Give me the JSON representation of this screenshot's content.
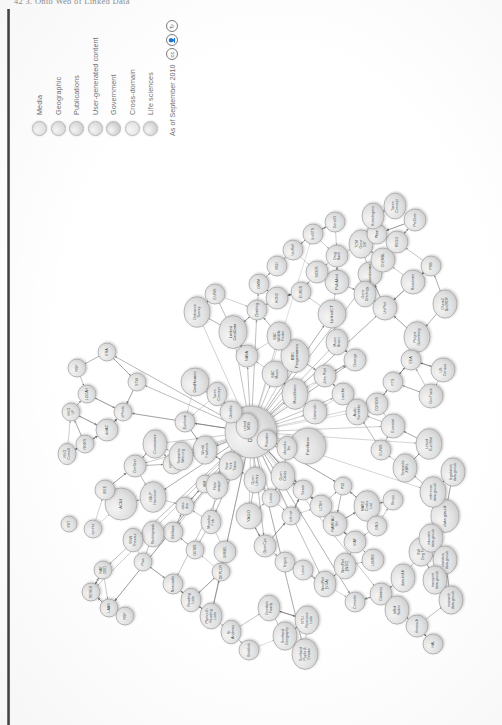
{
  "page": {
    "header": "42     3. Onto Web of Linked Data",
    "background_color": "#ffffff",
    "gutter_color": "#333333"
  },
  "figure": {
    "orientation": "rotated-90-ccw",
    "hub_node": "DBpedia"
  },
  "legend": {
    "items": [
      {
        "label": "Media",
        "color": "#e2e2e2"
      },
      {
        "label": "Geographic",
        "color": "#dcdcdc"
      },
      {
        "label": "Publications",
        "color": "#d6d6d6"
      },
      {
        "label": "User-generated content",
        "color": "#dadada"
      },
      {
        "label": "Government",
        "color": "#cdcdcd"
      },
      {
        "label": "Cross-domain",
        "color": "#e4e4e4"
      },
      {
        "label": "Life sciences",
        "color": "#d2d2d2"
      }
    ],
    "date_text": "As of September 2010",
    "license_icons": [
      "cc-circle-icon",
      "cc-by-icon",
      "cc-sa-icon"
    ]
  },
  "chart_data": {
    "type": "diagram",
    "subtitle": "As of September 2010",
    "node_count_approx": 203,
    "categories": [
      "Media",
      "Geographic",
      "Publications",
      "User-generated content",
      "Government",
      "Cross-domain",
      "Life sciences"
    ],
    "hub": "DBpedia",
    "nodes": [
      {
        "id": "DBpedia",
        "x": 280,
        "y": 226,
        "r": 26,
        "cat": "Cross-domain",
        "size": "big"
      },
      {
        "id": "Freebase",
        "x": 266,
        "y": 283,
        "r": 18,
        "cat": "Cross-domain",
        "size": "mid"
      },
      {
        "id": "GeoNames",
        "x": 330,
        "y": 170,
        "r": 14,
        "cat": "Geographic",
        "size": "mid"
      },
      {
        "id": "LinkedCT",
        "x": 398,
        "y": 307,
        "r": 14,
        "cat": "Life sciences",
        "size": "mid"
      },
      {
        "id": "PubMed",
        "x": 430,
        "y": 312,
        "r": 12,
        "cat": "Life sciences",
        "size": "mid"
      },
      {
        "id": "Diseasome",
        "x": 438,
        "y": 345,
        "r": 12,
        "cat": "Life sciences",
        "size": "mid"
      },
      {
        "id": "Gene\nOntology",
        "x": 418,
        "y": 340,
        "r": 11,
        "cat": "Life sciences"
      },
      {
        "id": "UniProt",
        "x": 404,
        "y": 360,
        "r": 12,
        "cat": "Life sciences"
      },
      {
        "id": "Project\nGutenberg",
        "x": 375,
        "y": 392,
        "r": 13,
        "cat": "Publications"
      },
      {
        "id": "ACM",
        "x": 208,
        "y": 96,
        "r": 16,
        "cat": "Publications",
        "size": "mid"
      },
      {
        "id": "IEEE",
        "x": 222,
        "y": 80,
        "r": 10,
        "cat": "Publications"
      },
      {
        "id": "CiteSeer",
        "x": 246,
        "y": 110,
        "r": 11,
        "cat": "Publications"
      },
      {
        "id": "DBLP\nHannover",
        "x": 215,
        "y": 128,
        "r": 13,
        "cat": "Publications"
      },
      {
        "id": "eprints",
        "x": 183,
        "y": 68,
        "r": 9,
        "cat": "Publications"
      },
      {
        "id": "RESEX",
        "x": 120,
        "y": 66,
        "r": 9,
        "cat": "Publications"
      },
      {
        "id": "RAE\n2001",
        "x": 142,
        "y": 78,
        "r": 9,
        "cat": "Publications"
      },
      {
        "id": "Pisa",
        "x": 150,
        "y": 118,
        "r": 9,
        "cat": "Publications"
      },
      {
        "id": "LAAS",
        "x": 104,
        "y": 84,
        "r": 9,
        "cat": "Publications"
      },
      {
        "id": "NSF",
        "x": 96,
        "y": 100,
        "r": 9,
        "cat": "Government"
      },
      {
        "id": "IRIT",
        "x": 188,
        "y": 44,
        "r": 8,
        "cat": "Publications"
      },
      {
        "id": "VIVO\nCornell",
        "x": 258,
        "y": 42,
        "r": 9,
        "cat": "Publications"
      },
      {
        "id": "VIVO\nUF",
        "x": 300,
        "y": 46,
        "r": 9,
        "cat": "Publications"
      },
      {
        "id": "RISKS",
        "x": 268,
        "y": 60,
        "r": 9,
        "cat": "Publications"
      },
      {
        "id": "LOCAH",
        "x": 318,
        "y": 62,
        "r": 9,
        "cat": "Publications"
      },
      {
        "id": "NSF",
        "x": 344,
        "y": 52,
        "r": 9,
        "cat": "Government"
      },
      {
        "id": "ERA",
        "x": 360,
        "y": 82,
        "r": 9,
        "cat": "Publications"
      },
      {
        "id": "dotAC",
        "x": 282,
        "y": 82,
        "r": 11,
        "cat": "Publications"
      },
      {
        "id": "ePrints",
        "x": 300,
        "y": 98,
        "r": 9,
        "cat": "Publications"
      },
      {
        "id": "STW",
        "x": 330,
        "y": 112,
        "r": 9,
        "cat": "Publications"
      },
      {
        "id": "Courseware",
        "x": 268,
        "y": 130,
        "r": 12,
        "cat": "Publications"
      },
      {
        "id": "RDF\nohloh",
        "x": 248,
        "y": 148,
        "r": 10,
        "cat": "User-generated content"
      },
      {
        "id": "BibBase",
        "x": 180,
        "y": 148,
        "r": 10,
        "cat": "Publications"
      },
      {
        "id": "data\ndcs",
        "x": 206,
        "y": 160,
        "r": 9,
        "cat": "Publications"
      },
      {
        "id": "IBM",
        "x": 228,
        "y": 180,
        "r": 9,
        "cat": "Cross-domain"
      },
      {
        "id": "Newcastle",
        "x": 128,
        "y": 148,
        "r": 10,
        "cat": "Government"
      },
      {
        "id": "Reading\nLists",
        "x": 112,
        "y": 166,
        "r": 10,
        "cat": "Publications"
      },
      {
        "id": "Plymouth\nReading\nLists",
        "x": 96,
        "y": 186,
        "r": 11,
        "cat": "Publications"
      },
      {
        "id": "St.\nAndrews",
        "x": 80,
        "y": 206,
        "r": 10,
        "cat": "Publications"
      },
      {
        "id": "Bricklink",
        "x": 62,
        "y": 224,
        "r": 10,
        "cat": "User-generated content"
      },
      {
        "id": "UMBEL",
        "x": 160,
        "y": 200,
        "r": 11,
        "cat": "Cross-domain"
      },
      {
        "id": "YAGO",
        "x": 196,
        "y": 224,
        "r": 13,
        "cat": "Cross-domain",
        "size": "mid"
      },
      {
        "id": "OpenCyc",
        "x": 166,
        "y": 240,
        "r": 11,
        "cat": "Cross-domain"
      },
      {
        "id": "lingvoj",
        "x": 150,
        "y": 260,
        "r": 10,
        "cat": "Cross-domain"
      },
      {
        "id": "Lexvo",
        "x": 142,
        "y": 278,
        "r": 10,
        "cat": "Cross-domain"
      },
      {
        "id": "WordNet\n(VUA)",
        "x": 128,
        "y": 300,
        "r": 11,
        "cat": "Cross-domain"
      },
      {
        "id": "WordNet\n(W3C)",
        "x": 146,
        "y": 320,
        "r": 11,
        "cat": "Cross-domain"
      },
      {
        "id": "Cornetto",
        "x": 110,
        "y": 330,
        "r": 10,
        "cat": "Cross-domain"
      },
      {
        "id": "Open\nCalais",
        "x": 236,
        "y": 258,
        "r": 12,
        "cat": "Cross-domain"
      },
      {
        "id": "Sears",
        "x": 222,
        "y": 278,
        "r": 10,
        "cat": "Publications"
      },
      {
        "id": "LCSH",
        "x": 206,
        "y": 296,
        "r": 11,
        "cat": "Publications"
      },
      {
        "id": "RAMEAU\nSH",
        "x": 188,
        "y": 310,
        "r": 12,
        "cat": "Publications"
      },
      {
        "id": "VIAF",
        "x": 170,
        "y": 330,
        "r": 11,
        "cat": "Publications"
      },
      {
        "id": "LIBRIS",
        "x": 152,
        "y": 348,
        "r": 11,
        "cat": "Publications"
      },
      {
        "id": "MARC\nCodes\nList",
        "x": 206,
        "y": 342,
        "r": 13,
        "cat": "Publications"
      },
      {
        "id": "P20",
        "x": 226,
        "y": 318,
        "r": 9,
        "cat": "Publications"
      },
      {
        "id": "GND",
        "x": 186,
        "y": 352,
        "r": 10,
        "cat": "Publications"
      },
      {
        "id": "NTU\nResource\nLists",
        "x": 92,
        "y": 282,
        "r": 12,
        "cat": "Publications"
      },
      {
        "id": "Calames",
        "x": 118,
        "y": 356,
        "r": 11,
        "cat": "Publications"
      },
      {
        "id": "IdRef\nSudoc",
        "x": 102,
        "y": 372,
        "r": 12,
        "cat": "Publications"
      },
      {
        "id": "theses.fr",
        "x": 86,
        "y": 392,
        "r": 11,
        "cat": "Publications"
      },
      {
        "id": "HAL",
        "x": 68,
        "y": 408,
        "r": 10,
        "cat": "Publications"
      },
      {
        "id": "data.bnf.fr",
        "x": 134,
        "y": 378,
        "r": 12,
        "cat": "Publications"
      },
      {
        "id": "SW\nDog Food",
        "x": 160,
        "y": 396,
        "r": 12,
        "cat": "Publications"
      },
      {
        "id": "Revyu",
        "x": 212,
        "y": 368,
        "r": 10,
        "cat": "User-generated content"
      },
      {
        "id": "Semantic\nXBRL",
        "x": 244,
        "y": 380,
        "r": 12,
        "cat": "Government"
      },
      {
        "id": "EUNIS",
        "x": 262,
        "y": 356,
        "r": 10,
        "cat": "Government"
      },
      {
        "id": "Eurostat",
        "x": 286,
        "y": 368,
        "r": 12,
        "cat": "Government"
      },
      {
        "id": "CORDIS",
        "x": 308,
        "y": 352,
        "r": 11,
        "cat": "Government"
      },
      {
        "id": "FTS",
        "x": 330,
        "y": 368,
        "r": 10,
        "cat": "Government"
      },
      {
        "id": "EEA",
        "x": 352,
        "y": 386,
        "r": 10,
        "cat": "Government"
      },
      {
        "id": "Linked\nEuroStat",
        "x": 268,
        "y": 404,
        "r": 13,
        "cat": "Government"
      },
      {
        "id": "GovTrack",
        "x": 316,
        "y": 406,
        "r": 12,
        "cat": "Government"
      },
      {
        "id": "US\nCensus",
        "x": 342,
        "y": 418,
        "r": 12,
        "cat": "Government"
      },
      {
        "id": "data.gov.uk",
        "x": 196,
        "y": 420,
        "r": 14,
        "cat": "Government",
        "size": "mid"
      },
      {
        "id": "reference\ndata.gov.uk",
        "x": 220,
        "y": 408,
        "r": 13,
        "cat": "Government"
      },
      {
        "id": "educatio\ndata.gov.uk",
        "x": 174,
        "y": 406,
        "r": 12,
        "cat": "Government"
      },
      {
        "id": "statistics\ndata.gov.uk",
        "x": 152,
        "y": 420,
        "r": 12,
        "cat": "Government"
      },
      {
        "id": "transport\ndata.gov.uk",
        "x": 132,
        "y": 410,
        "r": 12,
        "cat": "Government"
      },
      {
        "id": "research\ndata.gov.uk",
        "x": 112,
        "y": 426,
        "r": 12,
        "cat": "Government"
      },
      {
        "id": "legislation\ndata.gov.uk",
        "x": 240,
        "y": 428,
        "r": 12,
        "cat": "Government"
      },
      {
        "id": "Ordnance\nSurvey",
        "x": 400,
        "y": 172,
        "r": 13,
        "cat": "Geographic"
      },
      {
        "id": "EUNIS",
        "x": 418,
        "y": 190,
        "r": 10,
        "cat": "Geographic"
      },
      {
        "id": "Linked\nGeoData",
        "x": 380,
        "y": 208,
        "r": 14,
        "cat": "Geographic",
        "size": "mid"
      },
      {
        "id": "NASA",
        "x": 356,
        "y": 222,
        "r": 11,
        "cat": "Cross-domain"
      },
      {
        "id": "Climbing",
        "x": 402,
        "y": 232,
        "r": 10,
        "cat": "Geographic"
      },
      {
        "id": "BBC\nMusic",
        "x": 338,
        "y": 250,
        "r": 13,
        "cat": "Media"
      },
      {
        "id": "BBC\nProgrammes",
        "x": 356,
        "y": 270,
        "r": 14,
        "cat": "Media",
        "size": "mid"
      },
      {
        "id": "BBC\nWildlife\nFinder",
        "x": 376,
        "y": 254,
        "r": 12,
        "cat": "Media"
      },
      {
        "id": "MusicBrainz",
        "x": 318,
        "y": 270,
        "r": 13,
        "cat": "Media"
      },
      {
        "id": "Jamendo",
        "x": 300,
        "y": 290,
        "r": 12,
        "cat": "Media"
      },
      {
        "id": "John Peel",
        "x": 336,
        "y": 300,
        "r": 11,
        "cat": "Media"
      },
      {
        "id": "Last.fm",
        "x": 318,
        "y": 318,
        "r": 11,
        "cat": "Media"
      },
      {
        "id": "Audio\nScrobbler",
        "x": 300,
        "y": 332,
        "r": 11,
        "cat": "Media"
      },
      {
        "id": "Discogs",
        "x": 352,
        "y": 330,
        "r": 11,
        "cat": "Media"
      },
      {
        "id": "Music\nBrainz",
        "x": 370,
        "y": 312,
        "r": 11,
        "cat": "Media"
      },
      {
        "id": "New\nYork\nTimes",
        "x": 246,
        "y": 206,
        "r": 12,
        "cat": "Media"
      },
      {
        "id": "Flickr\nwrappr",
        "x": 226,
        "y": 192,
        "r": 11,
        "cat": "Media"
      },
      {
        "id": "World\nFactbook",
        "x": 262,
        "y": 180,
        "r": 12,
        "cat": "Cross-domain"
      },
      {
        "id": "Eurécom",
        "x": 290,
        "y": 160,
        "r": 10,
        "cat": "Publications"
      },
      {
        "id": "Semantic\nWeb.org",
        "x": 256,
        "y": 156,
        "r": 12,
        "cat": "Publications"
      },
      {
        "id": "totl.net",
        "x": 196,
        "y": 266,
        "r": 9,
        "cat": "Cross-domain"
      },
      {
        "id": "Goodwin\nFamily",
        "x": 104,
        "y": 244,
        "r": 11,
        "cat": "User-generated content"
      },
      {
        "id": "Linked\nMDB",
        "x": 286,
        "y": 222,
        "r": 11,
        "cat": "Media"
      },
      {
        "id": "Pokedex",
        "x": 272,
        "y": 242,
        "r": 10,
        "cat": "User-generated content"
      },
      {
        "id": "Lotico",
        "x": 214,
        "y": 246,
        "r": 9,
        "cat": "User-generated content"
      },
      {
        "id": "Moseley\nFolk",
        "x": 190,
        "y": 186,
        "r": 10,
        "cat": "Media"
      },
      {
        "id": "GESIS",
        "x": 162,
        "y": 170,
        "r": 9,
        "cat": "Publications"
      },
      {
        "id": "DEPLOY",
        "x": 140,
        "y": 196,
        "r": 9,
        "cat": "Publications"
      },
      {
        "id": "Scotland\nGeography",
        "x": 76,
        "y": 260,
        "r": 12,
        "cat": "Geographic"
      },
      {
        "id": "Scotland\nPupils &\nExams",
        "x": 58,
        "y": 280,
        "r": 13,
        "cat": "Government"
      },
      {
        "id": "EURES",
        "x": 420,
        "y": 276,
        "r": 10,
        "cat": "Government"
      },
      {
        "id": "SIDER",
        "x": 440,
        "y": 292,
        "r": 11,
        "cat": "Life sciences"
      },
      {
        "id": "Drug\nBank",
        "x": 456,
        "y": 312,
        "r": 11,
        "cat": "Life sciences"
      },
      {
        "id": "TCM\nGene\nDIT",
        "x": 468,
        "y": 336,
        "r": 12,
        "cat": "Life sciences"
      },
      {
        "id": "ChEMBL",
        "x": 452,
        "y": 358,
        "r": 12,
        "cat": "Life sciences"
      },
      {
        "id": "KEGG",
        "x": 470,
        "y": 372,
        "r": 11,
        "cat": "Life sciences"
      },
      {
        "id": "Reactome",
        "x": 430,
        "y": 388,
        "r": 12,
        "cat": "Life sciences"
      },
      {
        "id": "PDB",
        "x": 446,
        "y": 406,
        "r": 10,
        "cat": "Life sciences"
      },
      {
        "id": "HGNC",
        "x": 414,
        "y": 252,
        "r": 11,
        "cat": "Life sciences"
      },
      {
        "id": "OMIM",
        "x": 428,
        "y": 234,
        "r": 10,
        "cat": "Life sciences"
      },
      {
        "id": "MGI",
        "x": 446,
        "y": 252,
        "r": 10,
        "cat": "Life sciences"
      },
      {
        "id": "UniRef",
        "x": 462,
        "y": 268,
        "r": 10,
        "cat": "Life sciences"
      },
      {
        "id": "UniSTS",
        "x": 478,
        "y": 288,
        "r": 10,
        "cat": "Life sciences"
      },
      {
        "id": "GeneID",
        "x": 490,
        "y": 310,
        "r": 10,
        "cat": "Life sciences"
      },
      {
        "id": "Pfam",
        "x": 478,
        "y": 352,
        "r": 10,
        "cat": "Life sciences"
      },
      {
        "id": "Homologene",
        "x": 496,
        "y": 348,
        "r": 11,
        "cat": "Life sciences"
      },
      {
        "id": "ProDom",
        "x": 492,
        "y": 390,
        "r": 11,
        "cat": "Life sciences"
      },
      {
        "id": "Taxon\nConcept",
        "x": 506,
        "y": 370,
        "r": 11,
        "cat": "Life sciences"
      },
      {
        "id": "Chem2\nBio2RDF",
        "x": 408,
        "y": 420,
        "r": 12,
        "cat": "Life sciences"
      },
      {
        "id": "Open\nLibrary",
        "x": 232,
        "y": 230,
        "r": 11,
        "cat": "Publications"
      },
      {
        "id": "Rechtspraak",
        "x": 178,
        "y": 128,
        "r": 11,
        "cat": "Government"
      },
      {
        "id": "SSW\nThesaur",
        "x": 172,
        "y": 108,
        "r": 10,
        "cat": "Publications"
      },
      {
        "id": "Uberblic",
        "x": 300,
        "y": 206,
        "r": 11,
        "cat": "Cross-domain"
      },
      {
        "id": "Taxon\nConcept",
        "x": 318,
        "y": 192,
        "r": 10,
        "cat": "Life sciences"
      },
      {
        "id": "dbpedia\nlite",
        "x": 264,
        "y": 262,
        "r": 10,
        "cat": "Cross-domain"
      }
    ]
  }
}
